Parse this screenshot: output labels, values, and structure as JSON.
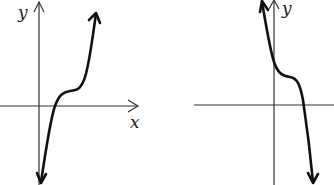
{
  "graphs": [
    {
      "id": "left",
      "x_label": "x",
      "y_label": "y",
      "description": "increasing cubic with a flat inflection above x-axis, x-intercept just right of origin"
    },
    {
      "id": "right",
      "x_label": "",
      "y_label": "y",
      "description": "decreasing cubic with a flat inflection above x-axis, positive y-intercept"
    }
  ]
}
